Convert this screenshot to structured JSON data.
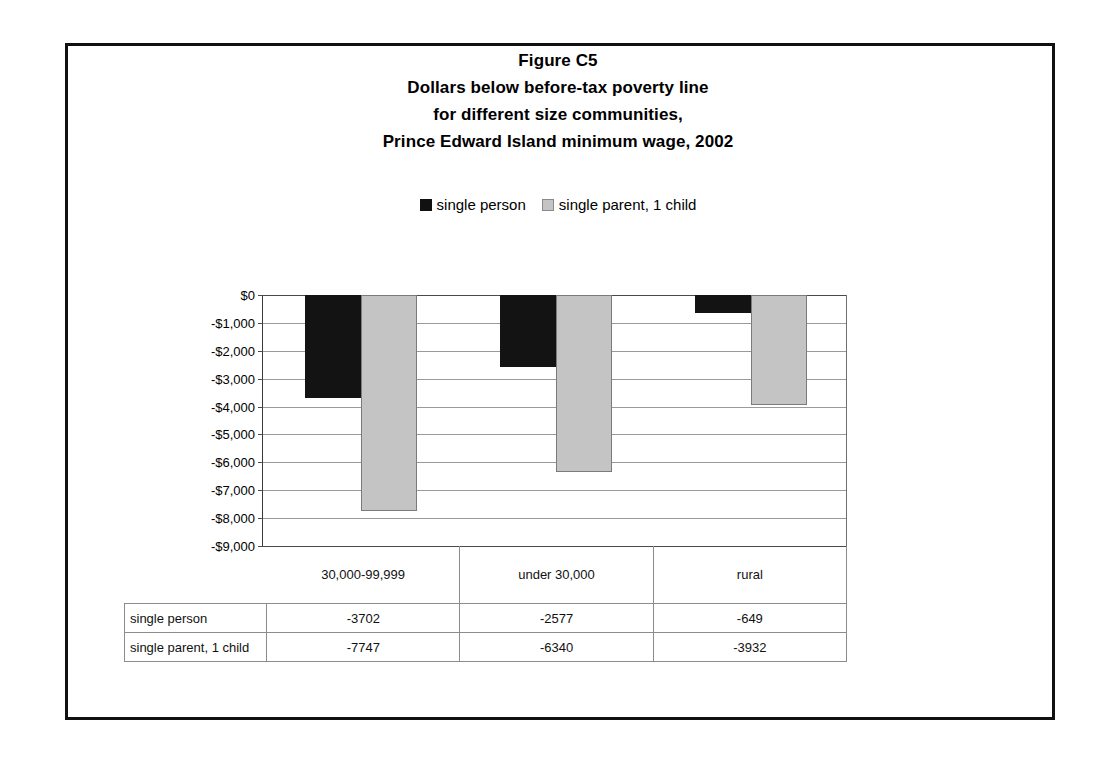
{
  "figure": {
    "title_lines": [
      "Figure C5",
      "Dollars below before-tax poverty line",
      "for different size communities,",
      "Prince Edward Island minimum wage, 2002"
    ]
  },
  "legend": {
    "entries": [
      {
        "label": "single person",
        "color": "#131313",
        "swatch": "dark"
      },
      {
        "label": "single parent, 1 child",
        "color": "#c4c4c4",
        "swatch": "light"
      }
    ]
  },
  "table": {
    "corner_label": "",
    "column_headers": [
      "30,000-99,999",
      "under 30,000",
      "rural"
    ],
    "rows": [
      {
        "label": "single person",
        "values": [
          "-3702",
          "-2577",
          "-649"
        ]
      },
      {
        "label": "single parent, 1 child",
        "values": [
          "-7747",
          "-6340",
          "-3932"
        ]
      }
    ]
  },
  "chart_data": {
    "type": "bar",
    "xlabel": "",
    "ylabel": "",
    "categories": [
      "30,000-99,999",
      "under 30,000",
      "rural"
    ],
    "series": [
      {
        "name": "single person",
        "color": "#131313",
        "values": [
          -3702,
          -2577,
          -649
        ]
      },
      {
        "name": "single parent, 1 child",
        "color": "#c4c4c4",
        "values": [
          -7747,
          -6340,
          -3932
        ]
      }
    ],
    "ylim": [
      -9000,
      0
    ],
    "ytick_labels": [
      "$0",
      "-$1,000",
      "-$2,000",
      "-$3,000",
      "-$4,000",
      "-$5,000",
      "-$6,000",
      "-$7,000",
      "-$8,000",
      "-$9,000"
    ],
    "ytick_values": [
      0,
      -1000,
      -2000,
      -3000,
      -4000,
      -5000,
      -6000,
      -7000,
      -8000,
      -9000
    ],
    "grid": true,
    "legend_position": "top-center"
  }
}
